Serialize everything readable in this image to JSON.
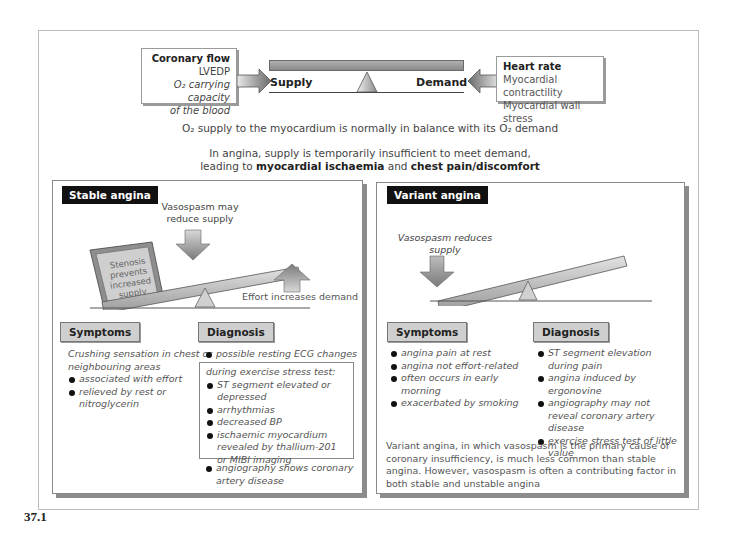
{
  "figure_label": "37.1",
  "balance": {
    "supply_factors": {
      "title": "Coronary flow",
      "items": [
        "LVEDP",
        "O₂ carrying capacity",
        "of the blood"
      ]
    },
    "demand_factors": {
      "title": "Heart rate",
      "items": [
        "Myocardial contractility",
        "Myocardial wall stress"
      ]
    },
    "supply_label": "Supply",
    "demand_label": "Demand"
  },
  "summary": {
    "line1": "O₂ supply to the myocardium is normally in balance with its O₂ demand",
    "line2": "In angina, supply is temporarily insufficient to meet demand,",
    "line3_prefix": "leading to ",
    "line3_bold1": "myocardial ischaemia",
    "line3_mid": " and ",
    "line3_bold2": "chest pain/discomfort"
  },
  "stable": {
    "title": "Stable angina",
    "vasospasm_label_1": "Vasospasm may",
    "vasospasm_label_2": "reduce supply",
    "stenosis_label": [
      "Stenosis",
      "prevents",
      "increased",
      "supply"
    ],
    "effort_label": "Effort increases demand",
    "symptoms": {
      "title": "Symptoms",
      "intro": "Crushing sensation in chest or neighbouring areas",
      "items": [
        "associated with effort",
        "relieved by rest or nitroglycerin"
      ]
    },
    "diagnosis": {
      "title": "Diagnosis",
      "items_top": [
        "possible resting ECG changes"
      ],
      "stress_test_heading": "during exercise stress test:",
      "stress_test_items": [
        "ST segment elevated or depressed",
        "arrhythmias",
        "decreased BP",
        "ischaemic myocardium revealed by thallium-201 or MIBI imaging"
      ],
      "items_bottom": [
        "angiography shows coronary artery disease"
      ]
    }
  },
  "variant": {
    "title": "Variant angina",
    "vasospasm_label_1": "Vasospasm reduces",
    "vasospasm_label_2": "supply",
    "symptoms": {
      "title": "Symptoms",
      "items": [
        "angina pain at rest",
        "angina not effort-related",
        "often occurs in early morning",
        "exacerbated by smoking"
      ]
    },
    "diagnosis": {
      "title": "Diagnosis",
      "items": [
        "ST segment elevation during pain",
        "angina induced by ergonovine",
        "angiography may not reveal coronary artery disease",
        "exercise stress test of little value"
      ]
    },
    "footnote": "Variant angina, in which vasospasm is the primary cause of coronary insufficiency, is much less common than stable angina. However, vasospasm is often a contributing factor in both stable and unstable angina"
  }
}
